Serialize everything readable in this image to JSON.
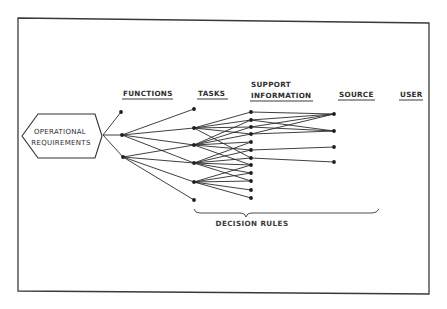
{
  "diagram": {
    "root": {
      "label_line1": "OPERATIONAL",
      "label_line2": "REQUIREMENTS"
    },
    "columns": {
      "functions": "FUNCTIONS",
      "tasks": "TASKS",
      "support_line1": "SUPPORT",
      "support_line2": "INFORMATION",
      "source": "SOURCE",
      "user": "USER"
    },
    "brace_label": "DECISION RULES",
    "colors": {
      "line": "#2a2a2a",
      "node": "#1e1e1e",
      "text": "#2e2e2e",
      "background": "#ffffff"
    },
    "nodes": {
      "functions": [
        {
          "id": "F1",
          "x": 121,
          "y": 112
        },
        {
          "id": "F2",
          "x": 122,
          "y": 135
        },
        {
          "id": "F3",
          "x": 123,
          "y": 157
        }
      ],
      "tasks": [
        {
          "id": "T1",
          "x": 194,
          "y": 109
        },
        {
          "id": "T2",
          "x": 194,
          "y": 128
        },
        {
          "id": "T3",
          "x": 194,
          "y": 145
        },
        {
          "id": "T4",
          "x": 194,
          "y": 163
        },
        {
          "id": "T5",
          "x": 194,
          "y": 182
        },
        {
          "id": "T6",
          "x": 194,
          "y": 200
        }
      ],
      "support_information": [
        {
          "id": "S1",
          "x": 251,
          "y": 112
        },
        {
          "id": "S2",
          "x": 251,
          "y": 120
        },
        {
          "id": "S3",
          "x": 251,
          "y": 127
        },
        {
          "id": "S4",
          "x": 251,
          "y": 134
        },
        {
          "id": "S5",
          "x": 251,
          "y": 142
        },
        {
          "id": "S6",
          "x": 251,
          "y": 150
        },
        {
          "id": "S7",
          "x": 251,
          "y": 158
        },
        {
          "id": "S8",
          "x": 251,
          "y": 165
        },
        {
          "id": "S9",
          "x": 251,
          "y": 173
        },
        {
          "id": "S10",
          "x": 251,
          "y": 181
        },
        {
          "id": "S11",
          "x": 251,
          "y": 190
        },
        {
          "id": "S12",
          "x": 251,
          "y": 198
        }
      ],
      "source": [
        {
          "id": "R1",
          "x": 334,
          "y": 114
        },
        {
          "id": "R2",
          "x": 334,
          "y": 131
        },
        {
          "id": "R3",
          "x": 334,
          "y": 147
        },
        {
          "id": "R4",
          "x": 334,
          "y": 162
        }
      ]
    },
    "edges": [
      [
        "ROOT",
        "F1"
      ],
      [
        "ROOT",
        "F2"
      ],
      [
        "ROOT",
        "F3"
      ],
      [
        "F2",
        "T1"
      ],
      [
        "F2",
        "T2"
      ],
      [
        "F2",
        "T3"
      ],
      [
        "F2",
        "T4"
      ],
      [
        "F3",
        "T3"
      ],
      [
        "F3",
        "T4"
      ],
      [
        "F3",
        "T5"
      ],
      [
        "F3",
        "T6"
      ],
      [
        "T2",
        "S1"
      ],
      [
        "T2",
        "S2"
      ],
      [
        "T2",
        "S3"
      ],
      [
        "T2",
        "S4"
      ],
      [
        "T2",
        "S7"
      ],
      [
        "T3",
        "S2"
      ],
      [
        "T3",
        "S3"
      ],
      [
        "T3",
        "S4"
      ],
      [
        "T3",
        "S5"
      ],
      [
        "T3",
        "S6"
      ],
      [
        "T3",
        "S8"
      ],
      [
        "T4",
        "S5"
      ],
      [
        "T4",
        "S6"
      ],
      [
        "T4",
        "S7"
      ],
      [
        "T4",
        "S8"
      ],
      [
        "T4",
        "S9"
      ],
      [
        "T4",
        "S10"
      ],
      [
        "T5",
        "S8"
      ],
      [
        "T5",
        "S9"
      ],
      [
        "T5",
        "S10"
      ],
      [
        "T5",
        "S11"
      ],
      [
        "T5",
        "S12"
      ],
      [
        "S1",
        "R1"
      ],
      [
        "S2",
        "R1"
      ],
      [
        "S2",
        "R2"
      ],
      [
        "S3",
        "R1"
      ],
      [
        "S3",
        "R2"
      ],
      [
        "S4",
        "R1"
      ],
      [
        "S4",
        "R2"
      ],
      [
        "S6",
        "R3"
      ],
      [
        "S7",
        "R4"
      ]
    ]
  }
}
